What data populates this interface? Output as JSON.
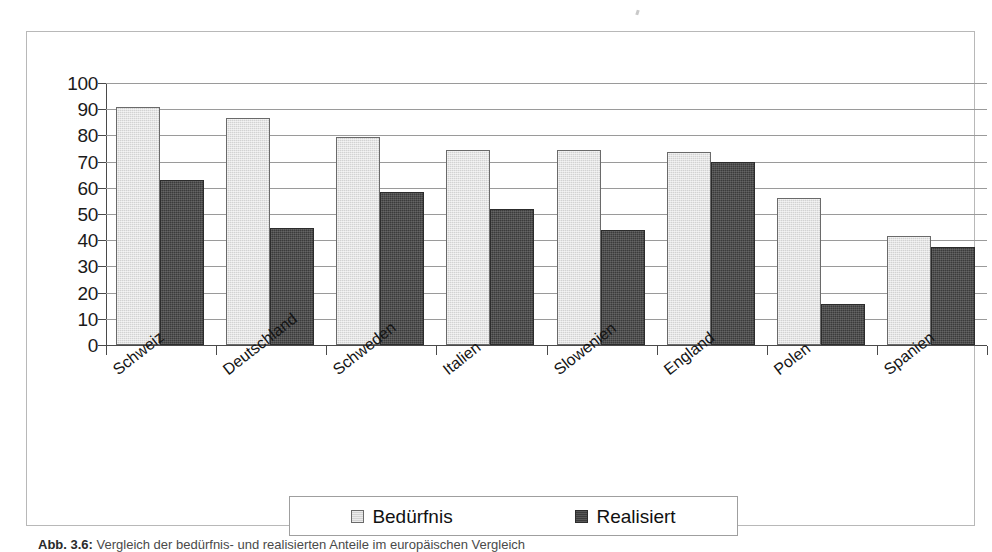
{
  "figure": {
    "caption_prefix": "Abb. 3.6:",
    "caption_text": "Vergleich der bedürfnis- und realisierten Anteile im europäischen Vergleich"
  },
  "legend": {
    "position": "bottom",
    "entries": [
      {
        "label": "Bedürfnis",
        "color": "#d2d2d2",
        "swatch": "need"
      },
      {
        "label": "Realisiert",
        "color": "#3b3b3b",
        "swatch": "real"
      }
    ]
  },
  "chart_data": {
    "type": "bar",
    "title": "",
    "xlabel": "",
    "ylabel": "",
    "ylim": [
      0,
      100
    ],
    "yticks": [
      0,
      10,
      20,
      30,
      40,
      50,
      60,
      70,
      80,
      90,
      100
    ],
    "grid": true,
    "categories": [
      "Schweiz",
      "Deutschland",
      "Schweden",
      "Italien",
      "Slowenien",
      "England",
      "Polen",
      "Spanien"
    ],
    "series": [
      {
        "name": "Bedürfnis",
        "color": "#d2d2d2",
        "values": [
          91,
          86.5,
          79.5,
          74.5,
          74.5,
          73.5,
          56,
          41.5
        ]
      },
      {
        "name": "Realisiert",
        "color": "#3b3b3b",
        "values": [
          63,
          44.5,
          58.5,
          52,
          44,
          70,
          15.5,
          37.5
        ]
      }
    ]
  }
}
